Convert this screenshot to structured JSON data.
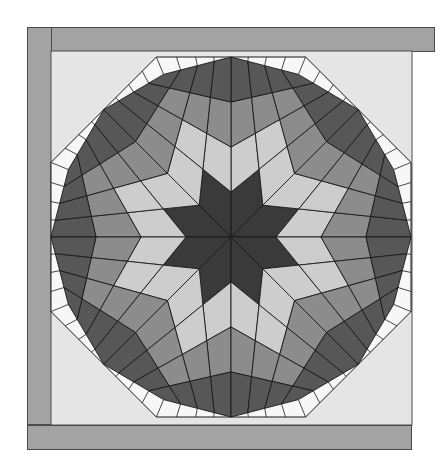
{
  "image": {
    "subject": "Lone Star quilt diagram",
    "width": 448,
    "height": 472
  },
  "colors": {
    "page_background": "#ffffff",
    "border_strip": "#a3a3a3",
    "border_line": "#4a4a4a",
    "panel_background": "#e5e5e5",
    "setting_triangle": "#f7f7f7",
    "seam_line": "#1a1a1a",
    "ring_colors": [
      "#3a3a3a",
      "#cdcdcd",
      "#8c8c8c",
      "#575757"
    ]
  },
  "frame": {
    "top_border": {
      "x": 27,
      "y": 27,
      "w": 408,
      "h": 25
    },
    "left_border": {
      "x": 27,
      "y": 27,
      "w": 25,
      "h": 398
    },
    "bottom_border": {
      "x": 27,
      "y": 425,
      "w": 385,
      "h": 25
    },
    "panel": {
      "x": 51,
      "y": 51,
      "w": 361,
      "h": 374
    }
  },
  "star": {
    "center": [
      231,
      237
    ],
    "points": 8,
    "grid": 4,
    "octagon_apothem": 180,
    "outer_corner_radius": 176,
    "ray_offset_deg": 0,
    "coloring": "max(i,j) ring index"
  }
}
